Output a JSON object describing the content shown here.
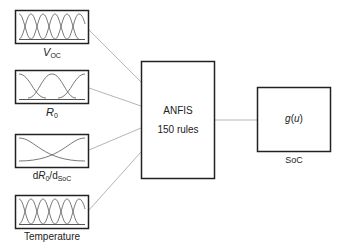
{
  "diagram": {
    "inputs": [
      {
        "id": "voc",
        "label_main": "V",
        "label_sub": "OC",
        "mf_count": 5
      },
      {
        "id": "r0",
        "label_main": "R",
        "label_sub": "0",
        "mf_count": 3
      },
      {
        "id": "dr0dsoc",
        "label_prefix": "d",
        "label_main": "R",
        "label_sub": "0",
        "label_mid": "/d",
        "label_sub2": "SoC",
        "mf_count": 2
      },
      {
        "id": "temperature",
        "label": "Temperature",
        "mf_count": 5
      }
    ],
    "anfis": {
      "title": "ANFIS",
      "subtitle": "150 rules"
    },
    "output": {
      "function": "g(u)",
      "func_name": "g",
      "func_arg": "u",
      "label": "SoC"
    },
    "colors": {
      "box_border": "#222222",
      "connector": "#b5b5b5",
      "curve": "#555555"
    }
  }
}
